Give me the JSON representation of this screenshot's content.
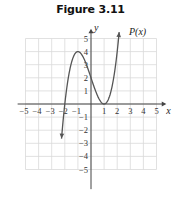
{
  "title": "Figure 3.11",
  "chart_data": {
    "type": "line",
    "title": "Figure 3.11",
    "xlabel": "x",
    "ylabel": "y",
    "function_label": "P(x)",
    "function": "P(x) = (x + 2)(x - 1)^2",
    "xlim": [
      -5,
      5
    ],
    "ylim": [
      -5,
      5
    ],
    "grid": true,
    "legend": "none",
    "x_ticks": [
      -5,
      -4,
      -3,
      -2,
      -1,
      1,
      2,
      3,
      4,
      5
    ],
    "y_ticks": [
      -5,
      -4,
      -3,
      -2,
      -1,
      1,
      2,
      3,
      4,
      5
    ],
    "series": [
      {
        "name": "P(x)",
        "x": [
          -2.25,
          -2,
          -1.75,
          -1.5,
          -1,
          -0.5,
          0,
          0.5,
          1,
          1.5,
          2,
          2.15
        ],
        "values": [
          -3.9,
          0,
          1.97,
          3.13,
          4,
          3.38,
          2,
          0.63,
          0,
          0.88,
          4,
          5.0
        ]
      }
    ],
    "key_points": [
      {
        "label": "x-intercept",
        "x": -2,
        "y": 0
      },
      {
        "label": "local maximum",
        "x": -1,
        "y": 4
      },
      {
        "label": "y-intercept",
        "x": 0,
        "y": 2
      },
      {
        "label": "x-intercept (double root)",
        "x": 1,
        "y": 0
      }
    ]
  }
}
